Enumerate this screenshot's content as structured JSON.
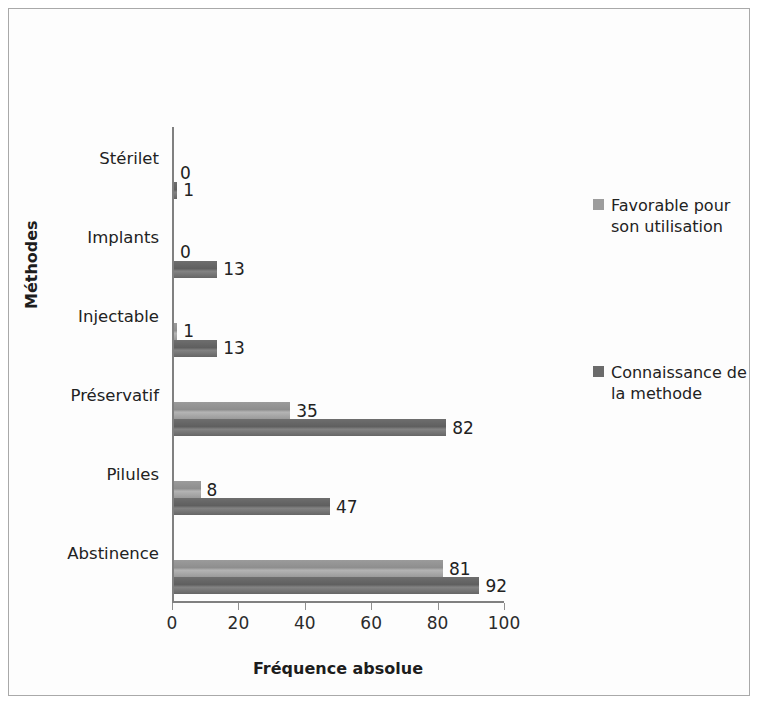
{
  "chart_data": {
    "type": "bar",
    "orientation": "horizontal",
    "title": "",
    "xlabel": "Fréquence absolue",
    "ylabel": "Méthodes",
    "xlim": [
      0,
      100
    ],
    "xticks": [
      0,
      20,
      40,
      60,
      80,
      100
    ],
    "grid": false,
    "legend_position": "right",
    "categories": [
      "Stérilet",
      "Implants",
      "Injectable",
      "Préservatif",
      "Pilules",
      "Abstinence"
    ],
    "series": [
      {
        "name": "Favorable pour son utilisation",
        "color": "#9d9d9d",
        "values": [
          0,
          0,
          1,
          35,
          8,
          81
        ]
      },
      {
        "name": "Connaissance de la methode",
        "color": "#6b6b6b",
        "values": [
          1,
          13,
          13,
          82,
          47,
          92
        ]
      }
    ]
  },
  "axes": {
    "x_title": "Fréquence absolue",
    "y_title": "Méthodes",
    "x_ticks": [
      "0",
      "20",
      "40",
      "60",
      "80",
      "100"
    ],
    "y_categories": [
      "Stérilet",
      "Implants",
      "Injectable",
      "Préservatif",
      "Pilules",
      "Abstinence"
    ]
  },
  "legend": {
    "entries": [
      {
        "label": "Favorable pour son utilisation"
      },
      {
        "label": "Connaissance de la methode"
      }
    ]
  },
  "labels": {
    "sterilet_favorable": "0",
    "sterilet_connaissance": "1",
    "implants_favorable": "0",
    "implants_connaissance": "13",
    "injectable_favorable": "1",
    "injectable_connaissance": "13",
    "preservatif_favorable": "35",
    "preservatif_connaissance": "82",
    "pilules_favorable": "8",
    "pilules_connaissance": "47",
    "abstinence_favorable": "81",
    "abstinence_connaissance": "92"
  }
}
